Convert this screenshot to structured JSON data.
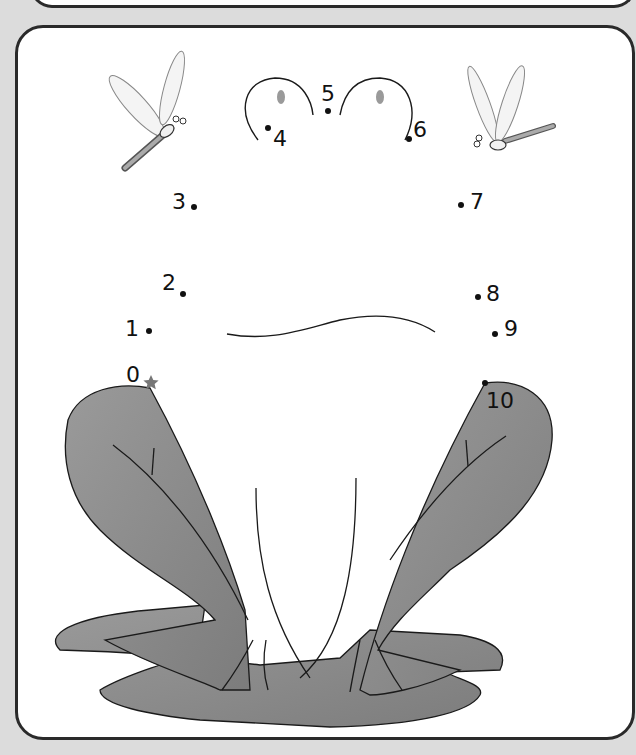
{
  "worksheet": {
    "subject": "frog",
    "type": "connect-the-dots",
    "start_marker": "star",
    "dots": [
      {
        "label": "0",
        "x": 151,
        "y": 383
      },
      {
        "label": "1",
        "x": 149,
        "y": 331
      },
      {
        "label": "2",
        "x": 183,
        "y": 294
      },
      {
        "label": "3",
        "x": 194,
        "y": 207
      },
      {
        "label": "4",
        "x": 268,
        "y": 128
      },
      {
        "label": "5",
        "x": 328,
        "y": 111
      },
      {
        "label": "6",
        "x": 409,
        "y": 139
      },
      {
        "label": "7",
        "x": 461,
        "y": 205
      },
      {
        "label": "8",
        "x": 478,
        "y": 297
      },
      {
        "label": "9",
        "x": 495,
        "y": 334
      },
      {
        "label": "10",
        "x": 485,
        "y": 383
      }
    ]
  },
  "colors": {
    "background": "#dcdcdc",
    "page": "#ffffff",
    "outline": "#2a2a2a",
    "frog_fill": "#8a8a8a",
    "lily_pad": "#909090",
    "eye": "#9a9a9a",
    "star": "#777777"
  }
}
